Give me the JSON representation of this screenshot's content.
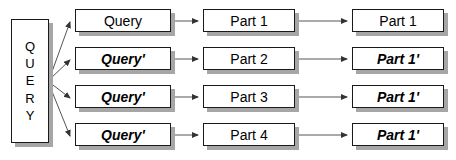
{
  "diagram": {
    "type": "flow-diagram",
    "width": 456,
    "height": 160,
    "background_color": "#ffffff",
    "box_fill_color": "#ffffff",
    "box_border_color": "#1a1a1a",
    "box_shadow_color": "#a6a6a6",
    "text_color": "#000000",
    "arrow_color": "#555555"
  },
  "source": {
    "name": "QUERY",
    "letters": [
      "Q",
      "U",
      "E",
      "R",
      "Y"
    ],
    "orientation": "vertical"
  },
  "columns": [
    {
      "id": "query-column",
      "label": "Query variants"
    },
    {
      "id": "part-column",
      "label": "Parts"
    },
    {
      "id": "output-column",
      "label": "Results"
    }
  ],
  "rows": [
    {
      "index": 1,
      "query": {
        "text": "Query",
        "style": "regular"
      },
      "part": {
        "text": "Part 1",
        "style": "regular"
      },
      "out": {
        "text": "Part 1",
        "style": "regular"
      }
    },
    {
      "index": 2,
      "query": {
        "text": "Query'",
        "style": "italic"
      },
      "part": {
        "text": "Part 2",
        "style": "regular"
      },
      "out": {
        "text": "Part 1'",
        "style": "italic"
      }
    },
    {
      "index": 3,
      "query": {
        "text": "Query'",
        "style": "italic"
      },
      "part": {
        "text": "Part 3",
        "style": "regular"
      },
      "out": {
        "text": "Part 1'",
        "style": "italic"
      }
    },
    {
      "index": 4,
      "query": {
        "text": "Query'",
        "style": "italic"
      },
      "part": {
        "text": "Part 4",
        "style": "regular"
      },
      "out": {
        "text": "Part 1'",
        "style": "italic"
      }
    }
  ]
}
